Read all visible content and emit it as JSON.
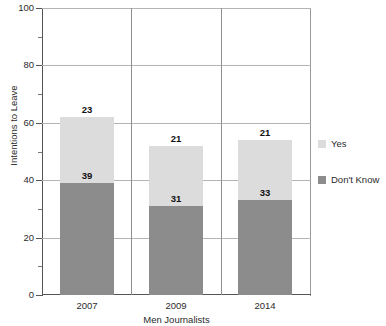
{
  "chart_data": {
    "type": "bar",
    "subtype": "stacked-bar",
    "title": "",
    "xlabel": "Men Journalists",
    "ylabel": "Intentions to Leave",
    "categories": [
      "2007",
      "2009",
      "2014"
    ],
    "series": [
      {
        "name": "Don't Know",
        "values": [
          39,
          31,
          33
        ],
        "color": "#8c8c8c"
      },
      {
        "name": "Yes",
        "values": [
          23,
          21,
          21
        ],
        "color": "#dcdcdc"
      }
    ],
    "totals": [
      62,
      52,
      54
    ],
    "ylim": [
      0,
      100
    ],
    "yticks": [
      0,
      20,
      40,
      60,
      80,
      100
    ],
    "ytick_labels": [
      "0",
      "20",
      "40",
      "60",
      "80",
      "100"
    ],
    "yminor_ticks": [
      10,
      30,
      50,
      70,
      90
    ],
    "grid": "horizontal-major-plus-category-separators",
    "legend_position": "right",
    "legend": [
      {
        "label": "Yes",
        "color": "#dcdcdc"
      },
      {
        "label": "Don't Know",
        "color": "#8c8c8c"
      }
    ],
    "data_labels": [
      {
        "category": "2007",
        "series": "Yes",
        "value": "23"
      },
      {
        "category": "2007",
        "series": "Don't Know",
        "value": "39"
      },
      {
        "category": "2009",
        "series": "Yes",
        "value": "21"
      },
      {
        "category": "2009",
        "series": "Don't Know",
        "value": "31"
      },
      {
        "category": "2014",
        "series": "Yes",
        "value": "21"
      },
      {
        "category": "2014",
        "series": "Don't Know",
        "value": "33"
      }
    ]
  }
}
